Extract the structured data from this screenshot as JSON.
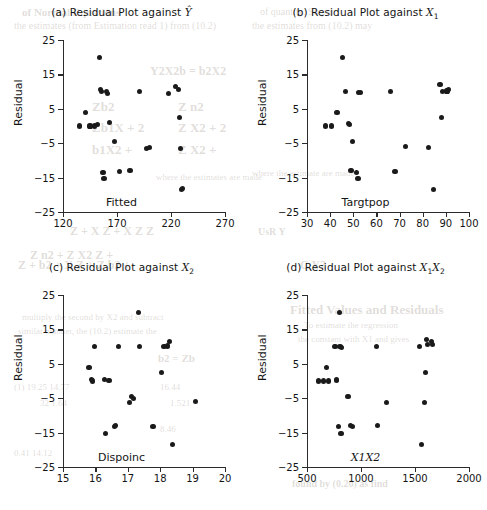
{
  "figure": {
    "background": "#ffffff",
    "point_color": "#1a1a1a",
    "axis_color": "#2b2b2b"
  },
  "bleed_through": [
    {
      "text": "of Normal Equations",
      "x": 22,
      "y": 6,
      "size": 11,
      "weight": "bold"
    },
    {
      "text": "the estimates (from Estimation read 1) from (10.2)",
      "x": 14,
      "y": 20,
      "size": 10,
      "weight": "normal"
    },
    {
      "text": "of quantity. So put",
      "x": 260,
      "y": 6,
      "size": 10,
      "weight": "normal"
    },
    {
      "text": "the estimates from (10.2) may",
      "x": 252,
      "y": 20,
      "size": 10,
      "weight": "normal"
    },
    {
      "text": "Y2X2b = b2X2",
      "x": 150,
      "y": 64,
      "size": 12,
      "weight": "bold"
    },
    {
      "text": "Zb2",
      "x": 92,
      "y": 99,
      "size": 13,
      "weight": "bold"
    },
    {
      "text": "Z n2",
      "x": 178,
      "y": 99,
      "size": 13,
      "weight": "bold"
    },
    {
      "text": "Zb1X + 2",
      "x": 92,
      "y": 120,
      "size": 13,
      "weight": "bold"
    },
    {
      "text": "Z X2 + 2",
      "x": 178,
      "y": 120,
      "size": 13,
      "weight": "bold"
    },
    {
      "text": "b1X2 +",
      "x": 92,
      "y": 142,
      "size": 13,
      "weight": "bold"
    },
    {
      "text": "Z X2 +",
      "x": 178,
      "y": 142,
      "size": 13,
      "weight": "bold"
    },
    {
      "text": "where the estimates are made",
      "x": 156,
      "y": 172,
      "size": 9,
      "weight": "normal"
    },
    {
      "text": "where the estimate are made",
      "x": 252,
      "y": 168,
      "size": 9,
      "weight": "normal"
    },
    {
      "text": "Z + X Z + X Z Z",
      "x": 70,
      "y": 224,
      "size": 12,
      "weight": "bold"
    },
    {
      "text": "Z n2 + Z X2 Z +",
      "x": 30,
      "y": 248,
      "size": 12,
      "weight": "bold"
    },
    {
      "text": "Z + b2 + X Z + Z b2 +",
      "x": 18,
      "y": 258,
      "size": 12,
      "weight": "bold"
    },
    {
      "text": "multiply the second by X2 and subtract",
      "x": 22,
      "y": 312,
      "size": 9,
      "weight": "normal"
    },
    {
      "text": "similar manner, the (10.2) estimate the",
      "x": 18,
      "y": 326,
      "size": 9,
      "weight": "normal"
    },
    {
      "text": "b2 = Zb",
      "x": 158,
      "y": 352,
      "size": 11,
      "weight": "bold"
    },
    {
      "text": "(1)  19.25   14.77",
      "x": 14,
      "y": 382,
      "size": 9,
      "weight": "normal"
    },
    {
      "text": "32   1.64",
      "x": 40,
      "y": 398,
      "size": 9,
      "weight": "normal"
    },
    {
      "text": "16.44",
      "x": 160,
      "y": 382,
      "size": 9,
      "weight": "normal"
    },
    {
      "text": "1.521",
      "x": 170,
      "y": 398,
      "size": 9,
      "weight": "normal"
    },
    {
      "text": "8.46",
      "x": 160,
      "y": 424,
      "size": 9,
      "weight": "normal"
    },
    {
      "text": "0.41  14.12",
      "x": 14,
      "y": 448,
      "size": 9,
      "weight": "normal"
    },
    {
      "text": "Fitted Values and Residuals",
      "x": 290,
      "y": 302,
      "size": 13,
      "weight": "bold"
    },
    {
      "text": "To estimate the regression",
      "x": 304,
      "y": 320,
      "size": 9,
      "weight": "normal"
    },
    {
      "text": "the constant with X1 and gives",
      "x": 298,
      "y": 334,
      "size": 9,
      "weight": "normal"
    },
    {
      "text": "found by (0.20) as find",
      "x": 292,
      "y": 478,
      "size": 10,
      "weight": "bold"
    },
    {
      "text": "C  Y2",
      "x": 300,
      "y": 258,
      "size": 12,
      "weight": "bold"
    },
    {
      "text": "UsR   Y",
      "x": 258,
      "y": 226,
      "size": 10,
      "weight": "bold"
    }
  ],
  "chart_data": [
    {
      "id": "a",
      "type": "scatter",
      "title": "(a) Residual Plot against",
      "title_var": "Y",
      "title_var_hat": true,
      "title_var_sub": "",
      "xlabel": "Fitted",
      "ylabel": "Residual",
      "xlim": [
        120,
        270
      ],
      "ylim": [
        -25,
        25
      ],
      "xticks": [
        120,
        170,
        220,
        270
      ],
      "yticks": [
        25,
        15,
        5,
        -5,
        -15,
        -25
      ],
      "grid": false,
      "x": [
        135,
        141,
        145,
        149,
        152,
        154,
        155,
        156,
        157,
        158,
        160,
        161,
        163,
        168,
        172,
        182,
        191,
        197,
        200,
        218,
        224,
        227,
        228,
        229,
        230,
        231
      ],
      "y": [
        0.0,
        4.0,
        0.0,
        0.0,
        0.5,
        20.0,
        10.5,
        10.0,
        -13.5,
        -15.2,
        10.0,
        9.5,
        1.0,
        -4.5,
        -13.2,
        -13.0,
        10.0,
        -6.5,
        -6.2,
        9.5,
        11.5,
        10.5,
        2.5,
        -6.5,
        -18.5,
        -18.2
      ]
    },
    {
      "id": "b",
      "type": "scatter",
      "title": "(b) Residual Plot against",
      "title_var": "X",
      "title_var_hat": false,
      "title_var_sub": "1",
      "xlabel": "Targtpop",
      "ylabel": "Residual",
      "xlim": [
        30,
        100
      ],
      "ylim": [
        -25,
        25
      ],
      "xticks": [
        30,
        40,
        50,
        60,
        70,
        80,
        90,
        100
      ],
      "yticks": [
        25,
        15,
        5,
        -5,
        -15,
        -25
      ],
      "grid": false,
      "x": [
        38.0,
        40.5,
        43.0,
        45.5,
        46.5,
        48.0,
        48.5,
        49.0,
        49.5,
        51.5,
        52.0,
        52.2,
        53.0,
        66.0,
        68.0,
        72.5,
        82.5,
        84.5,
        87.5,
        88.0,
        88.5,
        90.5,
        91.0
      ],
      "y": [
        0.0,
        0.0,
        4.0,
        20.0,
        10.0,
        0.8,
        0.5,
        -13.0,
        -4.5,
        -13.5,
        -15.2,
        9.8,
        9.8,
        10.0,
        -13.2,
        -6.0,
        -6.2,
        -18.5,
        12.0,
        2.5,
        10.0,
        10.2,
        10.5
      ]
    },
    {
      "id": "c",
      "type": "scatter",
      "title": "(c) Residual Plot against",
      "title_var": "X",
      "title_var_hat": false,
      "title_var_sub": "2",
      "xlabel": "Dispoinc",
      "ylabel": "Residual",
      "xlim": [
        15,
        20
      ],
      "ylim": [
        -25,
        25
      ],
      "xticks": [
        15,
        16,
        17,
        18,
        19,
        20
      ],
      "yticks": [
        25,
        15,
        5,
        -5,
        -15,
        -25
      ],
      "grid": false,
      "x": [
        15.8,
        15.88,
        15.92,
        15.98,
        16.28,
        16.32,
        16.42,
        16.58,
        16.62,
        16.72,
        17.05,
        17.12,
        17.18,
        17.32,
        17.35,
        17.78,
        18.05,
        18.12,
        18.22,
        18.28,
        18.38,
        19.08
      ],
      "y": [
        4.0,
        0.5,
        0.0,
        10.0,
        0.5,
        -15.2,
        0.2,
        -13.2,
        -13.0,
        10.0,
        -6.2,
        -4.5,
        -5.0,
        20.0,
        10.0,
        -13.2,
        2.5,
        10.0,
        10.2,
        11.5,
        -18.5,
        -6.0
      ]
    },
    {
      "id": "d",
      "type": "scatter",
      "title": "(d) Residual Plot against",
      "title_var": "X",
      "title_var_hat": false,
      "title_var_sub": "1X2",
      "xlabel": "X1X2",
      "ylabel": "Residual",
      "xlim": [
        500,
        2000
      ],
      "ylim": [
        -25,
        25
      ],
      "xticks": [
        500,
        1000,
        1500,
        2000
      ],
      "yticks": [
        25,
        15,
        5,
        -5,
        -15,
        -25
      ],
      "grid": false,
      "x": [
        610,
        650,
        680,
        700,
        760,
        770,
        775,
        790,
        800,
        805,
        815,
        820,
        880,
        900,
        920,
        1140,
        1150,
        1235,
        1545,
        1560,
        1585,
        1600,
        1610,
        1615,
        1650,
        1665
      ],
      "y": [
        0.0,
        0.0,
        4.0,
        0.0,
        10.0,
        0.5,
        0.2,
        -13.2,
        20.0,
        10.0,
        -15.2,
        9.8,
        -4.5,
        -13.0,
        -13.2,
        10.0,
        -13.0,
        -6.2,
        10.0,
        -18.5,
        -6.2,
        2.5,
        12.0,
        10.5,
        11.5,
        10.5
      ]
    }
  ]
}
